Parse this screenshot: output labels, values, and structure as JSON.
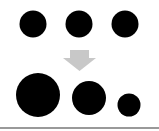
{
  "diagram": {
    "colors": {
      "circle": "#000000",
      "arrow": "#c8c8c8",
      "baseline": "#999999",
      "background": "#ffffff"
    },
    "top_row": [
      {
        "cx": 33,
        "cy": 24,
        "r": 13.5
      },
      {
        "cx": 79,
        "cy": 24,
        "r": 13.5
      },
      {
        "cx": 125,
        "cy": 24,
        "r": 13.5
      }
    ],
    "arrow": {
      "direction": "down"
    },
    "bottom_row": [
      {
        "cx": 38,
        "cy": 95,
        "r": 22
      },
      {
        "cx": 89,
        "cy": 98,
        "r": 17
      },
      {
        "cx": 129,
        "cy": 105,
        "r": 11.5
      }
    ]
  }
}
